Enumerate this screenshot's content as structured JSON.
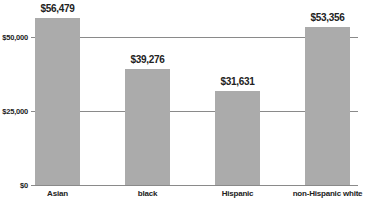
{
  "chart_data": {
    "type": "bar",
    "title": "",
    "xlabel": "",
    "ylabel": "",
    "categories": [
      "Asian",
      "black",
      "Hispanic",
      "non-Hispanic white"
    ],
    "values": [
      56479,
      39276,
      31631,
      53356
    ],
    "value_labels": [
      "$56,479",
      "$39,276",
      "$31,631",
      "$53,356"
    ],
    "ylim": [
      0,
      60000
    ],
    "yticks": [
      0,
      25000,
      50000
    ],
    "ytick_labels": [
      "$0",
      "$25,000",
      "$50,000"
    ],
    "grid": true,
    "legend": null,
    "bar_color": "#ababab"
  }
}
